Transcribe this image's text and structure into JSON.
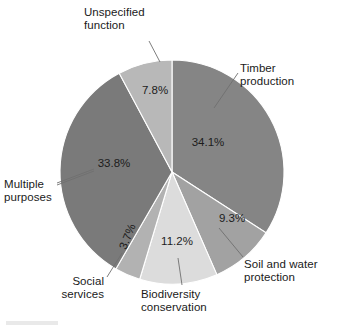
{
  "chart_data": {
    "type": "pie",
    "title": "",
    "subtitle": "",
    "xlabel": "",
    "ylabel": "",
    "legend_position": "none",
    "grid": false,
    "value_suffix": "%",
    "start_angle_deg": 0,
    "direction": "clockwise",
    "categories": [
      "Timber production",
      "Soil and water protection",
      "Biodiversity conservation",
      "Social services",
      "Multiple purposes",
      "Unspecified function"
    ],
    "values": [
      34.1,
      9.3,
      11.2,
      3.7,
      33.8,
      7.8
    ],
    "value_labels": [
      "34.1%",
      "9.3%",
      "11.2%",
      "3.7%",
      "33.8%",
      "7.8%"
    ],
    "colors": [
      "#858585",
      "#a2a2a2",
      "#dcdcdc",
      "#b2b2b2",
      "#7a7a7a",
      "#b8b8b8"
    ],
    "slices": [
      {
        "name": "timber-production",
        "label": "Timber\nproduction",
        "value": 34.1,
        "value_label": "34.1%",
        "color": "#858585"
      },
      {
        "name": "soil-and-water-protection",
        "label": "Soil and water\nprotection",
        "value": 9.3,
        "value_label": "9.3%",
        "color": "#a2a2a2"
      },
      {
        "name": "biodiversity-conservation",
        "label": "Biodiversity\nconservation",
        "value": 11.2,
        "value_label": "11.2%",
        "color": "#dcdcdc"
      },
      {
        "name": "social-services",
        "label": "Social\nservices",
        "value": 3.7,
        "value_label": "3.7%",
        "color": "#b2b2b2"
      },
      {
        "name": "multiple-purposes",
        "label": "Multiple\npurposes",
        "value": 33.8,
        "value_label": "33.8%",
        "color": "#7a7a7a"
      },
      {
        "name": "unspecified-function",
        "label": "Unspecified\nfunction",
        "value": 7.8,
        "value_label": "7.8%",
        "color": "#b8b8b8"
      }
    ]
  },
  "labels": {
    "timber": "Timber\nproduction",
    "soil": "Soil and water\nprotection",
    "biodiversity": "Biodiversity\nconservation",
    "social": "Social\nservices",
    "multiple": "Multiple\npurposes",
    "unspecified": "Unspecified\nfunction"
  },
  "percents": {
    "timber": "34.1%",
    "soil": "9.3%",
    "biodiversity": "11.2%",
    "social": "3.7%",
    "multiple": "33.8%",
    "unspecified": "7.8%"
  }
}
